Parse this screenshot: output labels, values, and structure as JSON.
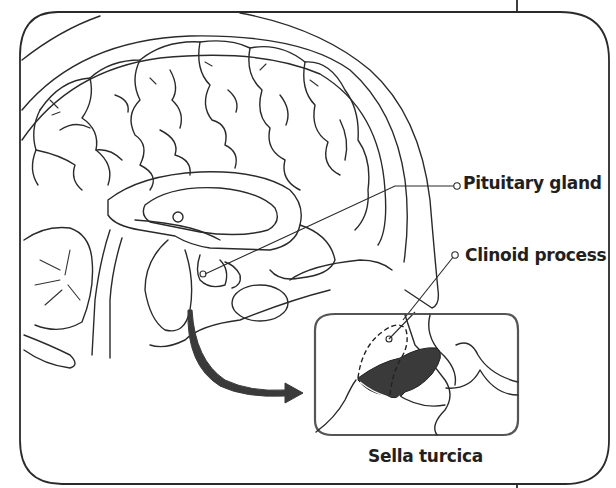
{
  "figure": {
    "type": "anatomical-diagram",
    "labels": {
      "pituitary_gland": "Pituitary gland",
      "clinoid_process": "Clinoid process",
      "sella_turcica": "Sella turcica"
    },
    "inset": {
      "caption": "Sella turcica",
      "highlighted_structure": "Pituitary gland (dark shaded)",
      "dashed_outline": "Clinoid process"
    },
    "arrow": "curved arrow from skull base to inset",
    "colors": {
      "line": "#2a2a2a",
      "shaded_gland": "#3a3a3a",
      "inset_border": "#555555",
      "background": "#ffffff"
    }
  }
}
